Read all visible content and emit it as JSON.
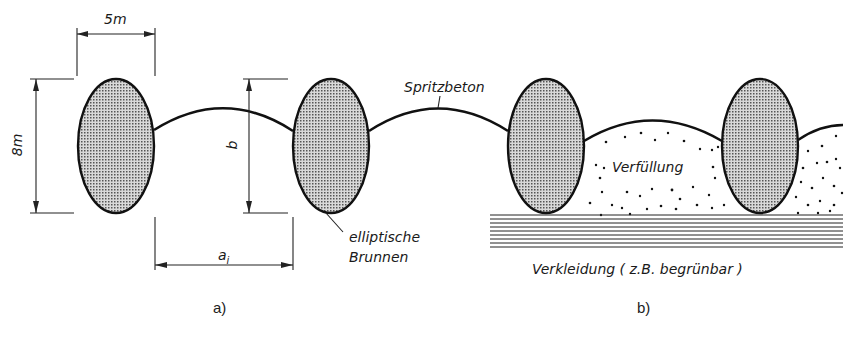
{
  "figure": {
    "panels": [
      {
        "id": "a",
        "caption": "a)"
      },
      {
        "id": "b",
        "caption": "b)"
      }
    ],
    "dimensions": {
      "width_label": "5m",
      "height_label": "8m",
      "b_label": "b",
      "spacing_label": "a",
      "spacing_subscript": "i"
    },
    "labels": {
      "shotcrete": "Spritzbeton",
      "wells_line1": "elliptische",
      "wells_line2": "Brunnen",
      "backfill": "Verfüllung",
      "cladding": "Verkleidung ( z.B. begrünbar )"
    },
    "colors": {
      "line": "#111111",
      "ellipse_fill": "#b8b8b8",
      "background": "#ffffff"
    }
  }
}
